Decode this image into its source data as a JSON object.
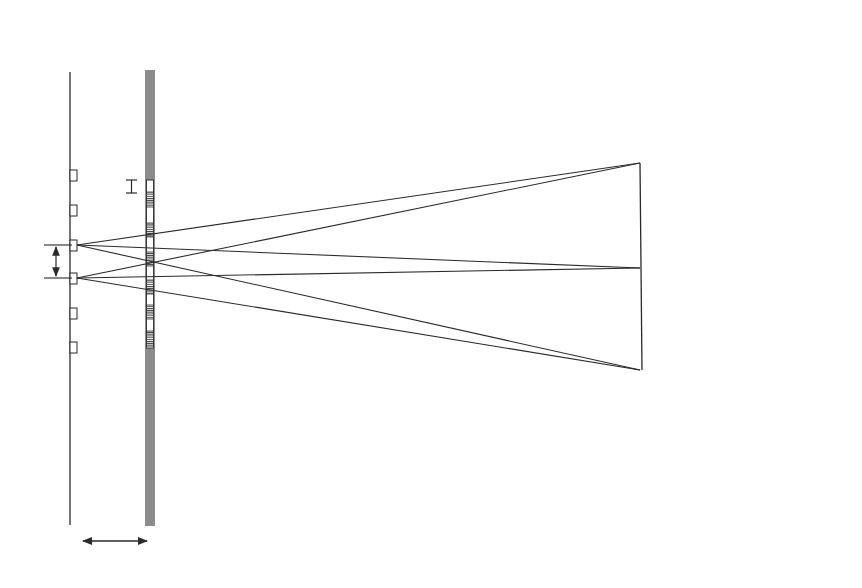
{
  "diagram": {
    "type": "optical-geometry",
    "labels": {
      "light_lines": "Light lines",
      "display": "Display",
      "viewing_windows_line1": "Viewing",
      "viewing_windows_line2": "windows",
      "pixel_width_symbol": "i",
      "pitch_symbol": "b",
      "window_width_symbol_upper": "e",
      "window_width_symbol_lower": "e",
      "gap_symbol": "g",
      "distance_symbol": "z"
    },
    "legend": [
      {
        "symbol": "e",
        "text": ", window width"
      },
      {
        "symbol": "b",
        "text": ", light line pitch"
      },
      {
        "symbol": "i",
        "text": ", pixel width"
      },
      {
        "symbol": "g",
        "text": ", gap between",
        "continuation": [
          "light lines and",
          "pixels"
        ]
      },
      {
        "symbol": "z",
        "text": ", distance to",
        "continuation": [
          "viewing windows"
        ]
      }
    ],
    "colors": {
      "line": "#2b2b2b",
      "display_bar": "#8c8c8c",
      "background": "#ffffff"
    }
  }
}
